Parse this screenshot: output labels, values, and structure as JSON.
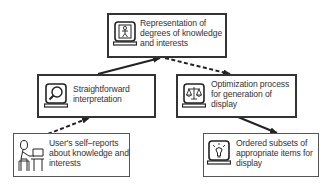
{
  "nodes": {
    "representation": {
      "label": "Representation of degrees of knowledge and interests",
      "lines": [
        "Representation of",
        "degrees of knowledge",
        "and interests"
      ],
      "icon": "person-on-monitor-icon"
    },
    "interpretation": {
      "label": "Straightforward interpretation",
      "lines": [
        "Straightforward",
        "interpretation"
      ],
      "icon": "magnifier-monitor-icon"
    },
    "optimization": {
      "label": "Optimization process for generation of display",
      "lines": [
        "Optimization process",
        "for generation of",
        "display"
      ],
      "icon": "scales-monitor-icon"
    },
    "self_reports": {
      "label": "User's self–reports about knowledge and interests",
      "lines": [
        "User's self–reports",
        "about knowledge and",
        "interests"
      ],
      "icon": "user-at-computer-icon"
    },
    "ordered_subsets": {
      "label": "Ordered subsets of appropriate items for display",
      "lines": [
        "Ordered subsets of",
        "appropriate items for",
        "display"
      ],
      "icon": "lightbulb-monitor-icon"
    }
  },
  "edges": [
    {
      "from": "self_reports",
      "to": "interpretation",
      "style": "dashed"
    },
    {
      "from": "interpretation",
      "to": "representation",
      "style": "solid"
    },
    {
      "from": "representation",
      "to": "optimization",
      "style": "dashed"
    },
    {
      "from": "optimization",
      "to": "ordered_subsets",
      "style": "solid"
    }
  ]
}
